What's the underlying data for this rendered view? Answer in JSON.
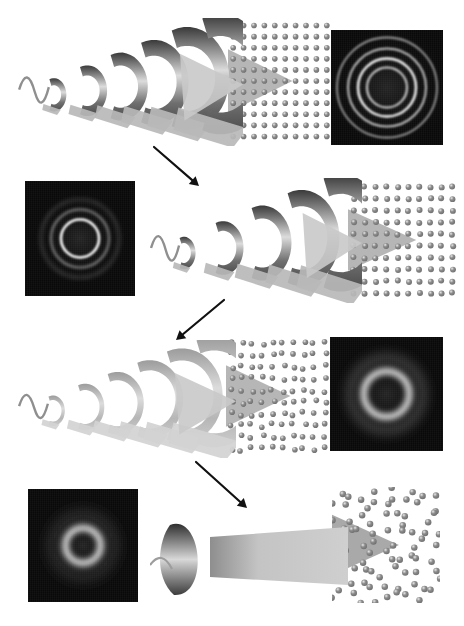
{
  "figure": {
    "background_color": "#ffffff",
    "width": 464,
    "height": 626,
    "panel_background": "#090909",
    "atom_color": "#8c8c8c",
    "atom_highlight": "#e8e8e8",
    "wave_dark": "#3a3a3a",
    "wave_light": "#dcdcdc",
    "arrow_color": "#111111"
  },
  "stages": [
    {
      "id": "stage-1",
      "label": "Stage 1",
      "state": "crystalline",
      "wave_amplitude": "high",
      "lattice_order": "ordered",
      "diffraction_description": "Four sharp concentric rings",
      "panel_side": "right",
      "panel": {
        "x": 331,
        "y": 30,
        "w": 112,
        "h": 115
      },
      "rings": [
        {
          "r": 20,
          "thickness": 2.0,
          "brightness": 0.85,
          "blur": 0.8
        },
        {
          "r": 29,
          "thickness": 2.4,
          "brightness": 1.0,
          "blur": 0.8
        },
        {
          "r": 39,
          "thickness": 2.0,
          "brightness": 0.78,
          "blur": 1.0
        },
        {
          "r": 50,
          "thickness": 1.8,
          "brightness": 0.62,
          "blur": 1.2
        }
      ],
      "lattice": {
        "x": 228,
        "y": 20,
        "w": 104,
        "h": 122,
        "type": "square",
        "cols": 10,
        "rows": 11,
        "jitter": 0
      },
      "waves": {
        "x": 18,
        "y": 18,
        "w": 225,
        "h": 128,
        "crests": 6,
        "amplitude": 1.0
      }
    },
    {
      "id": "stage-2",
      "label": "Stage 2",
      "state": "partially disordered",
      "wave_amplitude": "medium-high",
      "lattice_order": "mostly ordered",
      "diffraction_description": "One bright inner ring with two faint outer rings",
      "panel_side": "left",
      "panel": {
        "x": 25,
        "y": 181,
        "w": 110,
        "h": 115
      },
      "rings": [
        {
          "r": 19,
          "thickness": 2.6,
          "brightness": 1.0,
          "blur": 0.9
        },
        {
          "r": 29,
          "thickness": 2.0,
          "brightness": 0.55,
          "blur": 1.6
        },
        {
          "r": 39,
          "thickness": 1.6,
          "brightness": 0.34,
          "blur": 2.2
        }
      ],
      "lattice": {
        "x": 348,
        "y": 181,
        "w": 110,
        "h": 118,
        "type": "square",
        "cols": 10,
        "rows": 10,
        "jitter": 0.05
      },
      "waves": {
        "x": 150,
        "y": 178,
        "w": 212,
        "h": 125,
        "crests": 5,
        "amplitude": 0.85
      }
    },
    {
      "id": "stage-3",
      "label": "Stage 3",
      "state": "strongly disordered",
      "wave_amplitude": "low",
      "lattice_order": "partially disordered",
      "diffraction_description": "Single broad diffuse halo",
      "panel_side": "right",
      "panel": {
        "x": 330,
        "y": 337,
        "w": 113,
        "h": 114
      },
      "rings": [
        {
          "r": 23,
          "thickness": 6.0,
          "brightness": 1.0,
          "blur": 3.2
        },
        {
          "r": 36,
          "thickness": 7.0,
          "brightness": 0.3,
          "blur": 6.0
        }
      ],
      "lattice": {
        "x": 226,
        "y": 337,
        "w": 104,
        "h": 118,
        "type": "square",
        "cols": 10,
        "rows": 10,
        "jitter": 0.16
      },
      "waves": {
        "x": 18,
        "y": 340,
        "w": 218,
        "h": 118,
        "crests": 6,
        "amplitude": 0.45
      }
    },
    {
      "id": "stage-4",
      "label": "Stage 4",
      "state": "amorphous",
      "wave_amplitude": "flat",
      "lattice_order": "amorphous",
      "diffraction_description": "Single bright diffuse halo, no outer rings",
      "panel_side": "left",
      "panel": {
        "x": 28,
        "y": 489,
        "w": 110,
        "h": 113
      },
      "rings": [
        {
          "r": 18,
          "thickness": 6.5,
          "brightness": 1.0,
          "blur": 3.0
        },
        {
          "r": 30,
          "thickness": 8.0,
          "brightness": 0.22,
          "blur": 7.0
        }
      ],
      "lattice": {
        "x": 332,
        "y": 487,
        "w": 108,
        "h": 116,
        "type": "amorphous",
        "cols": 9,
        "rows": 9,
        "jitter": 0.42
      },
      "waves": {
        "x": 150,
        "y": 505,
        "w": 200,
        "h": 100,
        "crests": 1,
        "amplitude": 0.12
      }
    }
  ],
  "arrows": [
    {
      "id": "arrow-1",
      "from": [
        154,
        147
      ],
      "to": [
        199,
        186
      ],
      "direction": "down-right"
    },
    {
      "id": "arrow-2",
      "from": [
        224,
        300
      ],
      "to": [
        176,
        340
      ],
      "direction": "down-left"
    },
    {
      "id": "arrow-3",
      "from": [
        196,
        462
      ],
      "to": [
        247,
        508
      ],
      "direction": "down-right"
    }
  ]
}
